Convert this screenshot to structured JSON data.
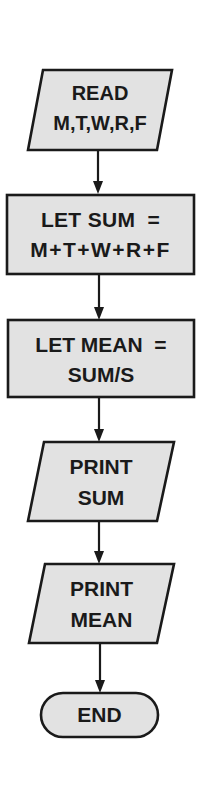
{
  "flowchart": {
    "nodes": [
      {
        "id": "read",
        "shape": "parallelogram",
        "line1": "READ",
        "line2": "M,T,W,R,F"
      },
      {
        "id": "let_sum",
        "shape": "rectangle",
        "line1": "LET SUM  =",
        "line2": "M+T+W+R+F"
      },
      {
        "id": "let_mean",
        "shape": "rectangle",
        "line1": "LET MEAN  =",
        "line2": "SUM/S"
      },
      {
        "id": "print_sum",
        "shape": "parallelogram",
        "line1": "PRINT",
        "line2": "SUM"
      },
      {
        "id": "print_mean",
        "shape": "parallelogram",
        "line1": "PRINT",
        "line2": "MEAN"
      },
      {
        "id": "end",
        "shape": "terminator",
        "line1": "END"
      }
    ],
    "edges": [
      {
        "from": "read",
        "to": "let_sum"
      },
      {
        "from": "let_sum",
        "to": "let_mean"
      },
      {
        "from": "let_mean",
        "to": "print_sum"
      },
      {
        "from": "print_sum",
        "to": "print_mean"
      },
      {
        "from": "print_mean",
        "to": "end"
      }
    ],
    "colors": {
      "fill": "#e2e2e2",
      "stroke": "#1a1a1a",
      "background": "#ffffff"
    }
  }
}
